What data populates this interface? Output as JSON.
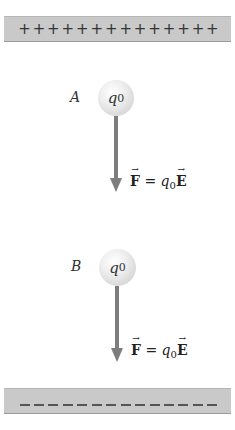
{
  "top_plate": {
    "sign": "+",
    "count": 14,
    "charge": "positive",
    "color": "#c9c9c9"
  },
  "bottom_plate": {
    "sign": "−",
    "count": 14,
    "charge": "negative",
    "color": "#c9c9c9"
  },
  "charges": [
    {
      "point_label": "A",
      "charge_symbol": "q",
      "charge_subscript": "0",
      "force_label": {
        "vector": "F",
        "equals": " = ",
        "coefficient": "q",
        "coefficient_subscript": "0",
        "field_vector": "E"
      },
      "arrow_direction": "down"
    },
    {
      "point_label": "B",
      "charge_symbol": "q",
      "charge_subscript": "0",
      "force_label": {
        "vector": "F",
        "equals": " = ",
        "coefficient": "q",
        "coefficient_subscript": "0",
        "field_vector": "E"
      },
      "arrow_direction": "down"
    }
  ],
  "colors": {
    "arrow": "#7d7d7d",
    "plate": "#c9c9c9",
    "text": "#222222"
  }
}
